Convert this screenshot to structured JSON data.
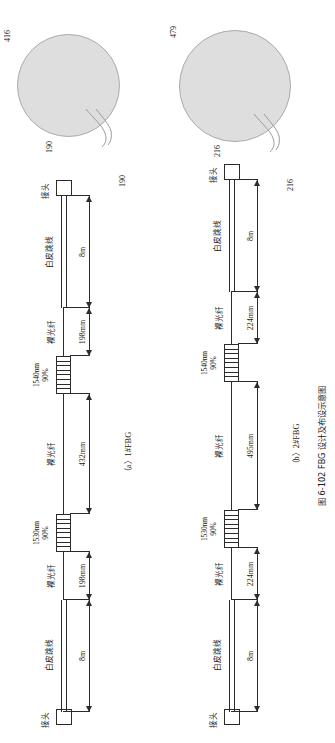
{
  "figure": {
    "number": "图 6-102",
    "title": "FBG 设计及布设示意图",
    "caption_full": "图 6-102  FBG 设计及布设示意图"
  },
  "subfigures": [
    {
      "id": "a",
      "caption": "（a）1#FBG",
      "specimen": {
        "diameter_label": "416",
        "lead_label_top": "190",
        "lead_label_bottom": "190",
        "fill_color": "#dedede",
        "edge_color": "#aaaaaa"
      },
      "segments": [
        {
          "name": "connector-left",
          "label": "接头"
        },
        {
          "name": "jacket-left",
          "label": "白皮跳线",
          "dimension": "8m"
        },
        {
          "name": "bare-fiber-left",
          "label": "裸光纤",
          "dimension": "198mm"
        },
        {
          "name": "fbg-1530",
          "label": "1530nm\n90%"
        },
        {
          "name": "bare-fiber-middle",
          "label": "裸光纤",
          "dimension": "432mm"
        },
        {
          "name": "fbg-1540",
          "label": "1540nm\n90%"
        },
        {
          "name": "bare-fiber-right",
          "label": "裸光纤",
          "dimension": "198mm"
        },
        {
          "name": "jacket-right",
          "label": "白皮跳线",
          "dimension": "8m"
        },
        {
          "name": "connector-right",
          "label": "接头"
        }
      ],
      "labels": {
        "connector": "接头",
        "jacket": "白皮跳线",
        "bare_fiber": "裸光纤",
        "fbg_1530_wavelength": "1530nm",
        "fbg_1530_reflectivity": "90%",
        "fbg_1540_wavelength": "1540nm",
        "fbg_1540_reflectivity": "90%",
        "dim_jacket_left": "8m",
        "dim_bare_left": "198mm",
        "dim_bare_middle": "432mm",
        "dim_bare_right": "198mm",
        "dim_jacket_right": "8m"
      }
    },
    {
      "id": "b",
      "caption": "（b）2#FBG",
      "specimen": {
        "diameter_label": "479",
        "lead_label_top": "216",
        "lead_label_bottom": "216",
        "fill_color": "#dedede",
        "edge_color": "#aaaaaa"
      },
      "segments": [
        {
          "name": "connector-left",
          "label": "接头"
        },
        {
          "name": "jacket-left",
          "label": "白皮跳线",
          "dimension": "8m"
        },
        {
          "name": "bare-fiber-left",
          "label": "裸光纤",
          "dimension": "224mm"
        },
        {
          "name": "fbg-1530",
          "label": "1530nm\n90%"
        },
        {
          "name": "bare-fiber-middle",
          "label": "裸光纤",
          "dimension": "495mm"
        },
        {
          "name": "fbg-1540",
          "label": "1540nm\n90%"
        },
        {
          "name": "bare-fiber-right",
          "label": "裸光纤",
          "dimension": "224mm"
        },
        {
          "name": "jacket-right",
          "label": "白皮跳线",
          "dimension": "8m"
        },
        {
          "name": "connector-right",
          "label": "接头"
        }
      ],
      "labels": {
        "connector": "接头",
        "jacket": "白皮跳线",
        "bare_fiber": "裸光纤",
        "fbg_1530_wavelength": "1530nm",
        "fbg_1530_reflectivity": "90%",
        "fbg_1540_wavelength": "1540nm",
        "fbg_1540_reflectivity": "90%",
        "dim_jacket_left": "8m",
        "dim_bare_left": "224mm",
        "dim_bare_middle": "495mm",
        "dim_bare_right": "224mm",
        "dim_jacket_right": "8m"
      }
    }
  ]
}
